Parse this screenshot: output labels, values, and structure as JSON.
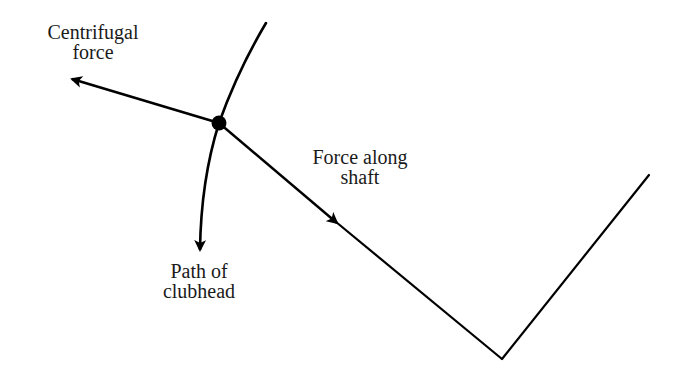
{
  "diagram": {
    "type": "force-diagram",
    "labels": {
      "centrifugal": [
        "Centrifugal",
        "force"
      ],
      "shaft": [
        "Force along",
        "shaft"
      ],
      "path": [
        "Path of",
        "clubhead"
      ]
    },
    "colors": {
      "stroke": "#000000",
      "text": "#1a1a1a",
      "background": "#ffffff"
    },
    "elements": {
      "clubhead_point": {
        "x": 219,
        "y": 123,
        "r": 7
      },
      "path_curve_top": {
        "x": 266,
        "y": 23
      },
      "path_arrow_tip": {
        "x": 199,
        "y": 252
      },
      "centrifugal_arrow_tip": {
        "x": 69,
        "y": 78
      },
      "shaft_arrow_tip": {
        "x": 336,
        "y": 223
      },
      "shaft_vertex": {
        "x": 502,
        "y": 359
      },
      "arm_end": {
        "x": 649,
        "y": 175
      }
    }
  }
}
